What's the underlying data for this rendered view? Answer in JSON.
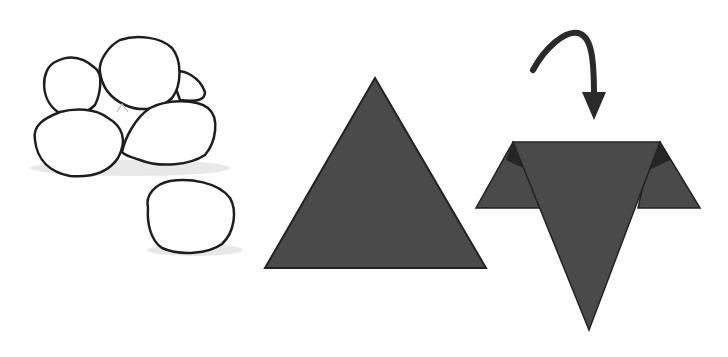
{
  "figure": {
    "colors": {
      "background": "#ffffff",
      "outline": "#1e1e1e",
      "fill_dark": "#4a4a4a",
      "fill_darker": "#2a2a2a",
      "shadow": "#e6e6e6"
    },
    "panels": [
      {
        "name": "rice-balls",
        "count": 6
      },
      {
        "name": "triangle-sheet"
      },
      {
        "name": "folded-sheet",
        "arrow": "fold-arrow"
      }
    ]
  }
}
